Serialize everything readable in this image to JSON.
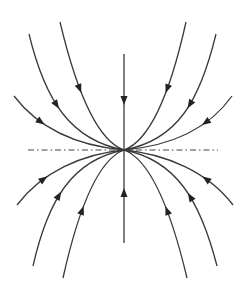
{
  "figure": {
    "type": "phase-portrait",
    "colors": {
      "stroke": "#3a3a3a",
      "background": "#ffffff"
    },
    "center": [
      124,
      150
    ],
    "dash_line": {
      "x1": 28,
      "x2": 218,
      "y": 150,
      "style": "dash-dot"
    },
    "trajectories": [
      {
        "id": "top-1",
        "d": "M14,96 C40,130 80,146 124,150",
        "arrow": [
          38,
          125
        ],
        "dir": "in"
      },
      {
        "id": "top-2",
        "d": "M29,34 C45,100 70,140 124,150",
        "arrow": [
          50,
          108
        ],
        "dir": "in"
      },
      {
        "id": "top-3",
        "d": "M60,22 C75,85 95,140 124,150",
        "arrow": [
          77,
          89
        ],
        "dir": "in"
      },
      {
        "id": "top-4",
        "d": "M124,54 L124,150",
        "arrow": [
          124,
          100
        ],
        "dir": "in"
      },
      {
        "id": "top-5",
        "d": "M186,22 C172,85 152,140 124,150",
        "arrow": [
          170,
          89
        ],
        "dir": "in"
      },
      {
        "id": "top-6",
        "d": "M216,34 C200,100 178,140 124,150",
        "arrow": [
          196,
          108
        ],
        "dir": "in"
      },
      {
        "id": "top-7",
        "d": "M232,96 C208,130 168,146 124,150",
        "arrow": [
          208,
          125
        ],
        "dir": "in"
      },
      {
        "id": "bot-1",
        "d": "M17,205 C42,172 82,154 124,150",
        "arrow": [
          40,
          175
        ],
        "dir": "in"
      },
      {
        "id": "bot-2",
        "d": "M33,266 C48,200 72,160 124,150",
        "arrow": [
          52,
          192
        ],
        "dir": "in"
      },
      {
        "id": "bot-3",
        "d": "M63,278 C77,215 97,160 124,150",
        "arrow": [
          79,
          210
        ],
        "dir": "in"
      },
      {
        "id": "bot-4",
        "d": "M124,243 L124,150",
        "arrow": [
          124,
          193
        ],
        "dir": "in"
      },
      {
        "id": "bot-5",
        "d": "M187,278 C172,215 152,160 124,150",
        "arrow": [
          170,
          210
        ],
        "dir": "in"
      },
      {
        "id": "bot-6",
        "d": "M217,266 C200,200 176,160 124,150",
        "arrow": [
          198,
          192
        ],
        "dir": "in"
      },
      {
        "id": "bot-7",
        "d": "M233,205 C208,172 166,154 124,150",
        "arrow": [
          210,
          175
        ],
        "dir": "in"
      }
    ]
  }
}
